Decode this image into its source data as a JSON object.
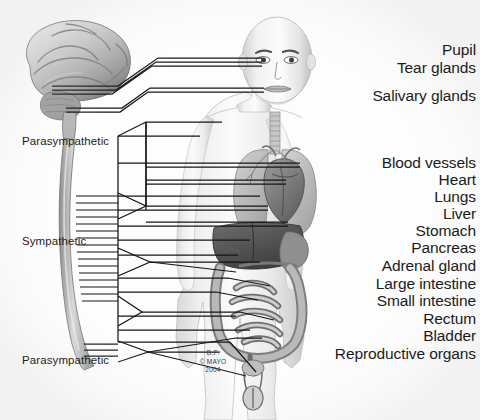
{
  "figure": {
    "background_color": "#fdfdfd",
    "line_color": "#1a1a1a",
    "text_color": "#1b1b1b"
  },
  "divisions": [
    {
      "id": "parasympathetic-cranial",
      "label": "Parasympathetic",
      "x": 22,
      "y": 136
    },
    {
      "id": "sympathetic",
      "label": "Sympathetic",
      "x": 22,
      "y": 236
    },
    {
      "id": "parasympathetic-sacral",
      "label": "Parasympathetic",
      "x": 22,
      "y": 355
    }
  ],
  "head_labels": [
    {
      "id": "pupil",
      "label": "Pupil",
      "y": 42
    },
    {
      "id": "tear-glands",
      "label": "Tear glands",
      "y": 60
    },
    {
      "id": "salivary-glands",
      "label": "Salivary glands",
      "y": 88
    }
  ],
  "organ_labels": [
    {
      "id": "blood-vessels",
      "label": "Blood vessels",
      "y": 155
    },
    {
      "id": "heart",
      "label": "Heart",
      "y": 172
    },
    {
      "id": "lungs",
      "label": "Lungs",
      "y": 189
    },
    {
      "id": "liver",
      "label": "Liver",
      "y": 206
    },
    {
      "id": "stomach",
      "label": "Stomach",
      "y": 223
    },
    {
      "id": "pancreas",
      "label": "Pancreas",
      "y": 240
    },
    {
      "id": "adrenal-gland",
      "label": "Adrenal gland",
      "y": 258
    },
    {
      "id": "large-intestine",
      "label": "Large intestine",
      "y": 276
    },
    {
      "id": "small-intestine",
      "label": "Small intestine",
      "y": 293
    },
    {
      "id": "rectum",
      "label": "Rectum",
      "y": 311
    },
    {
      "id": "bladder",
      "label": "Bladder",
      "y": 328
    },
    {
      "id": "reproductive-organs",
      "label": "Reproductive organs",
      "y": 346
    }
  ],
  "credit": {
    "artist": "D.F.",
    "copyright": "© MAYO",
    "year": "2004"
  }
}
